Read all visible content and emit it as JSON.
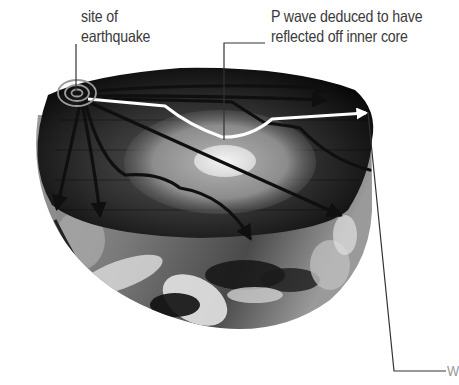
{
  "diagram": {
    "labels": {
      "earthquake_site": [
        "site of",
        "earthquake"
      ],
      "reflected_p_wave": [
        "P wave deduced to have",
        "reflected off inner core"
      ],
      "right_edge_label": "W"
    },
    "elements": {
      "hemisphere": "cut-away Earth hemisphere with satellite cloud imagery",
      "inner_core": "bright central ellipse",
      "outer_core": "lighter grey ellipse surrounding inner core",
      "mantle": "dark region",
      "focus": "concentric rings marking earthquake site",
      "wave_paths": "dark arrows radiating from focus, refracting at core boundary",
      "highlighted_path": "white P-wave path reflecting off inner core"
    },
    "colors": {
      "mantle": "#1a1a1a",
      "outer_core": "#8a8a8a",
      "inner_core": "#e8e8e8",
      "highlight_path": "#ffffff",
      "wave_paths": "#0f0f0f",
      "leader_lines": "#333333",
      "label_text": "#3a3a3a"
    }
  }
}
